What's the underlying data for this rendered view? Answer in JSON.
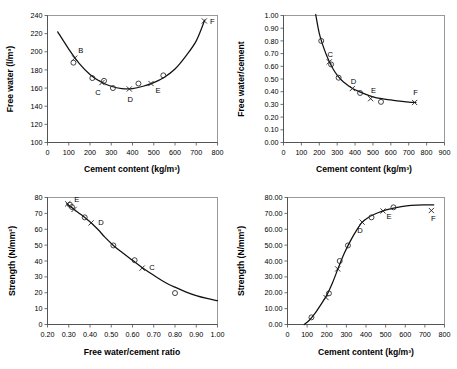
{
  "figure": {
    "background": "#ffffff",
    "panel_count": 4,
    "axis_color": "#4d4d4d",
    "curve_color": "#111111",
    "marker_color": "#222222"
  },
  "chart_data": [
    {
      "id": "free-water-vs-cement",
      "position": "top-left",
      "type": "scatter",
      "title": "",
      "xlabel": "Cement content (kg/m³)",
      "ylabel": "Free water (l/m³)",
      "xlim": [
        0,
        800
      ],
      "ylim": [
        100,
        240
      ],
      "xticks": [
        0,
        100,
        200,
        300,
        400,
        500,
        600,
        700,
        800
      ],
      "xtick_labels": [
        "0",
        "100",
        "200",
        "300",
        "400",
        "500",
        "600",
        "700",
        "800"
      ],
      "yticks": [
        100,
        120,
        140,
        160,
        180,
        200,
        220,
        240
      ],
      "ytick_labels": [
        "100",
        "120",
        "140",
        "160",
        "180",
        "200",
        "220",
        "240"
      ],
      "grid": false,
      "legend": "none",
      "points_circle": [
        {
          "x": 122,
          "y": 188
        },
        {
          "x": 211,
          "y": 171
        },
        {
          "x": 266,
          "y": 168
        },
        {
          "x": 308,
          "y": 160
        },
        {
          "x": 428,
          "y": 165
        },
        {
          "x": 545,
          "y": 174
        }
      ],
      "points_cross": [
        {
          "x": 128,
          "y": 193,
          "label": "B"
        },
        {
          "x": 256,
          "y": 166,
          "label": "C"
        },
        {
          "x": 385,
          "y": 159,
          "label": "D"
        },
        {
          "x": 487,
          "y": 165,
          "label": "E"
        },
        {
          "x": 738,
          "y": 234,
          "label": "F"
        }
      ],
      "curve": [
        {
          "x": 48,
          "y": 222
        },
        {
          "x": 100,
          "y": 203
        },
        {
          "x": 150,
          "y": 187
        },
        {
          "x": 200,
          "y": 175
        },
        {
          "x": 250,
          "y": 167
        },
        {
          "x": 300,
          "y": 162
        },
        {
          "x": 350,
          "y": 159.5
        },
        {
          "x": 400,
          "y": 159.5
        },
        {
          "x": 450,
          "y": 162
        },
        {
          "x": 500,
          "y": 166
        },
        {
          "x": 550,
          "y": 172
        },
        {
          "x": 600,
          "y": 181
        },
        {
          "x": 650,
          "y": 195
        },
        {
          "x": 700,
          "y": 212
        },
        {
          "x": 740,
          "y": 235
        }
      ]
    },
    {
      "id": "free-water-cement-ratio-vs-cement",
      "position": "top-right",
      "type": "scatter",
      "title": "",
      "xlabel": "Cement content (kg/m³)",
      "ylabel": "Free water/cement",
      "xlim": [
        0,
        900
      ],
      "ylim": [
        0.0,
        1.0
      ],
      "xticks": [
        0,
        100,
        200,
        300,
        400,
        500,
        600,
        700,
        800,
        900
      ],
      "xtick_labels": [
        "0",
        "100",
        "200",
        "300",
        "400",
        "500",
        "600",
        "700",
        "800",
        "900"
      ],
      "yticks": [
        0.0,
        0.1,
        0.2,
        0.3,
        0.4,
        0.5,
        0.6,
        0.7,
        0.8,
        0.9,
        1.0
      ],
      "ytick_labels": [
        "0.00",
        "0.10",
        "0.20",
        "0.30",
        "0.40",
        "0.50",
        "0.60",
        "0.70",
        "0.80",
        "0.90",
        "1.00"
      ],
      "grid": false,
      "legend": "none",
      "points_circle": [
        {
          "x": 211,
          "y": 0.8
        },
        {
          "x": 266,
          "y": 0.615
        },
        {
          "x": 308,
          "y": 0.51
        },
        {
          "x": 428,
          "y": 0.39
        },
        {
          "x": 545,
          "y": 0.32
        }
      ],
      "points_cross": [
        {
          "x": 256,
          "y": 0.635,
          "label": "C"
        },
        {
          "x": 385,
          "y": 0.425,
          "label": "D"
        },
        {
          "x": 487,
          "y": 0.345,
          "label": "E"
        },
        {
          "x": 733,
          "y": 0.315,
          "label": "F"
        }
      ],
      "curve": [
        {
          "x": 180,
          "y": 1.02
        },
        {
          "x": 200,
          "y": 0.86
        },
        {
          "x": 225,
          "y": 0.745
        },
        {
          "x": 250,
          "y": 0.655
        },
        {
          "x": 275,
          "y": 0.585
        },
        {
          "x": 300,
          "y": 0.53
        },
        {
          "x": 325,
          "y": 0.49
        },
        {
          "x": 350,
          "y": 0.46
        },
        {
          "x": 375,
          "y": 0.435
        },
        {
          "x": 400,
          "y": 0.415
        },
        {
          "x": 450,
          "y": 0.385
        },
        {
          "x": 500,
          "y": 0.36
        },
        {
          "x": 550,
          "y": 0.345
        },
        {
          "x": 600,
          "y": 0.335
        },
        {
          "x": 650,
          "y": 0.325
        },
        {
          "x": 700,
          "y": 0.318
        },
        {
          "x": 740,
          "y": 0.315
        }
      ]
    },
    {
      "id": "strength-vs-water-cement-ratio",
      "position": "bottom-left",
      "type": "scatter",
      "title": "",
      "xlabel": "Free water/cement ratio",
      "ylabel": "Strength  (N/mm²)",
      "xlim": [
        0.2,
        1.0
      ],
      "ylim": [
        0,
        80
      ],
      "xticks": [
        0.2,
        0.3,
        0.4,
        0.5,
        0.6,
        0.7,
        0.8,
        0.9,
        1.0
      ],
      "xtick_labels": [
        "0.20",
        "0.30",
        "0.40",
        "0.50",
        "0.60",
        "0.70",
        "0.80",
        "0.90",
        "1.00"
      ],
      "yticks": [
        0,
        10,
        20,
        30,
        40,
        50,
        60,
        70,
        80
      ],
      "ytick_labels": [
        "0",
        "10",
        "20",
        "30",
        "40",
        "50",
        "60",
        "70",
        "80"
      ],
      "grid": false,
      "legend": "none",
      "points_circle": [
        {
          "x": 0.305,
          "y": 75.5
        },
        {
          "x": 0.315,
          "y": 74.0
        },
        {
          "x": 0.375,
          "y": 67.5
        },
        {
          "x": 0.51,
          "y": 49.8
        },
        {
          "x": 0.61,
          "y": 40.5
        },
        {
          "x": 0.8,
          "y": 19.8
        }
      ],
      "points_cross": [
        {
          "x": 0.295,
          "y": 76.0,
          "label": "E"
        },
        {
          "x": 0.325,
          "y": 72.5,
          "label": ""
        },
        {
          "x": 0.405,
          "y": 64.0,
          "label": "D"
        },
        {
          "x": 0.645,
          "y": 35.5,
          "label": "C"
        }
      ],
      "curve": [
        {
          "x": 0.29,
          "y": 76.0
        },
        {
          "x": 0.32,
          "y": 73.0
        },
        {
          "x": 0.35,
          "y": 70.0
        },
        {
          "x": 0.38,
          "y": 67.0
        },
        {
          "x": 0.41,
          "y": 63.5
        },
        {
          "x": 0.44,
          "y": 59.5
        },
        {
          "x": 0.47,
          "y": 55.0
        },
        {
          "x": 0.51,
          "y": 49.8
        },
        {
          "x": 0.55,
          "y": 45.5
        },
        {
          "x": 0.6,
          "y": 40.5
        },
        {
          "x": 0.65,
          "y": 35.5
        },
        {
          "x": 0.7,
          "y": 31.0
        },
        {
          "x": 0.75,
          "y": 26.8
        },
        {
          "x": 0.8,
          "y": 23.5
        },
        {
          "x": 0.85,
          "y": 20.6
        },
        {
          "x": 0.9,
          "y": 18.2
        },
        {
          "x": 0.95,
          "y": 16.4
        },
        {
          "x": 1.0,
          "y": 15.0
        }
      ]
    },
    {
      "id": "strength-vs-cement-content",
      "position": "bottom-right",
      "type": "scatter",
      "title": "",
      "xlabel": "Cement content (kg/m³)",
      "ylabel": "Strength  (N/mm²)",
      "xlim": [
        0,
        800
      ],
      "ylim": [
        0.0,
        80.0
      ],
      "xticks": [
        0,
        100,
        200,
        300,
        400,
        500,
        600,
        700,
        800
      ],
      "xtick_labels": [
        "0",
        "100",
        "200",
        "300",
        "400",
        "500",
        "600",
        "700",
        "800"
      ],
      "yticks": [
        0,
        10,
        20,
        30,
        40,
        50,
        60,
        70,
        80
      ],
      "ytick_labels": [
        "0.00",
        "10.00",
        "20.00",
        "30.00",
        "40.00",
        "50.00",
        "60.00",
        "70.00",
        "80.00"
      ],
      "grid": false,
      "legend": "none",
      "points_circle": [
        {
          "x": 122,
          "y": 4.5
        },
        {
          "x": 211,
          "y": 19.6
        },
        {
          "x": 266,
          "y": 40.0
        },
        {
          "x": 308,
          "y": 49.8
        },
        {
          "x": 428,
          "y": 67.5
        },
        {
          "x": 540,
          "y": 73.8
        }
      ],
      "points_cross": [
        {
          "x": 196,
          "y": 17.0,
          "label": ""
        },
        {
          "x": 256,
          "y": 35.0,
          "label": ""
        },
        {
          "x": 380,
          "y": 64.5,
          "label": "D"
        },
        {
          "x": 487,
          "y": 71.5,
          "label": "E"
        },
        {
          "x": 733,
          "y": 71.8,
          "label": "F"
        }
      ],
      "curve": [
        {
          "x": 85,
          "y": 0.0
        },
        {
          "x": 110,
          "y": 2.5
        },
        {
          "x": 140,
          "y": 7.0
        },
        {
          "x": 170,
          "y": 12.5
        },
        {
          "x": 200,
          "y": 18.5
        },
        {
          "x": 230,
          "y": 26.5
        },
        {
          "x": 260,
          "y": 36.0
        },
        {
          "x": 290,
          "y": 45.0
        },
        {
          "x": 320,
          "y": 52.5
        },
        {
          "x": 350,
          "y": 59.0
        },
        {
          "x": 380,
          "y": 64.3
        },
        {
          "x": 410,
          "y": 67.3
        },
        {
          "x": 440,
          "y": 69.3
        },
        {
          "x": 480,
          "y": 71.3
        },
        {
          "x": 530,
          "y": 73.0
        },
        {
          "x": 580,
          "y": 74.2
        },
        {
          "x": 630,
          "y": 75.0
        },
        {
          "x": 690,
          "y": 75.4
        },
        {
          "x": 745,
          "y": 75.3
        }
      ]
    }
  ]
}
